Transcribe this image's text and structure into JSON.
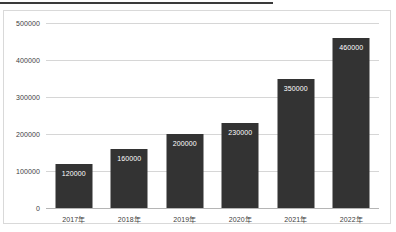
{
  "top_rule": {
    "present": true,
    "color": "#3a3a3a"
  },
  "chart_data": {
    "type": "bar",
    "title": "",
    "subtitle": "",
    "xlabel": "",
    "ylabel": "",
    "categories": [
      "2017年",
      "2018年",
      "2019年",
      "2020年",
      "2021年",
      "2022年"
    ],
    "values": [
      120000,
      160000,
      200000,
      230000,
      350000,
      460000
    ],
    "data_labels": [
      "120000",
      "160000",
      "200000",
      "230000",
      "350000",
      "460000"
    ],
    "ylim": [
      0,
      500000
    ],
    "yticks": [
      0,
      100000,
      200000,
      300000,
      400000,
      500000
    ],
    "ytick_labels": [
      "0",
      "100000",
      "200000",
      "300000",
      "400000",
      "500000"
    ],
    "grid": true,
    "grid_axis": "y",
    "legend": false,
    "legend_position": "none",
    "series": [
      {
        "name": "",
        "values": [
          120000,
          160000,
          200000,
          230000,
          350000,
          460000
        ]
      }
    ]
  },
  "style": {
    "bar_color": "#333333",
    "grid_color": "#d6d6d6",
    "axis_color": "#b5b5b5",
    "label_color": "#404040",
    "data_label_color": "#ffffff",
    "frame_border_color": "#d9d9d9",
    "background": "#ffffff"
  }
}
